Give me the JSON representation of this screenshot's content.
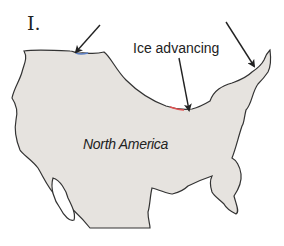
{
  "figure": {
    "panel_label": "I.",
    "annotation": "Ice advancing",
    "region_label": "North America",
    "arrows": [
      {
        "name": "arrow-northwest",
        "from": [
          100,
          25
        ],
        "to": [
          76,
          52
        ]
      },
      {
        "name": "arrow-ice-advancing",
        "from": [
          179,
          58
        ],
        "to": [
          189,
          110
        ]
      },
      {
        "name": "arrow-northeast",
        "from": [
          226,
          22
        ],
        "to": [
          254,
          66
        ]
      }
    ],
    "colors": {
      "land_fill": "#e6e3df",
      "outline": "#333333",
      "ice_edge_blue": "#5b7fc4",
      "ice_edge_red": "#e05050"
    }
  }
}
